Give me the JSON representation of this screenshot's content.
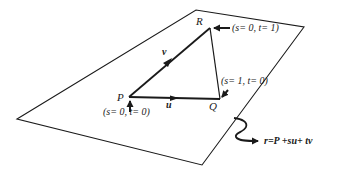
{
  "diagram": {
    "colors": {
      "ink": "#1a1a1a",
      "background": "#ffffff"
    },
    "plane": {
      "vertices": [
        [
          17,
          119
        ],
        [
          196,
          10
        ],
        [
          304,
          27
        ],
        [
          202,
          165
        ]
      ]
    },
    "points": {
      "P": {
        "label": "P",
        "x": 129,
        "y": 97,
        "param": "(s= 0, t= 0)"
      },
      "Q": {
        "label": "Q",
        "x": 220,
        "y": 99,
        "param": "(s= 1, t= 0)"
      },
      "R": {
        "label": "R",
        "x": 210,
        "y": 28,
        "param": "(s= 0, t= 1)"
      }
    },
    "vectors": {
      "u": {
        "label": "u",
        "from": "P",
        "to": "Q"
      },
      "v": {
        "label": "v",
        "from": "P",
        "to": "R"
      }
    },
    "equation": {
      "text": "r=P +su+ tv"
    }
  }
}
